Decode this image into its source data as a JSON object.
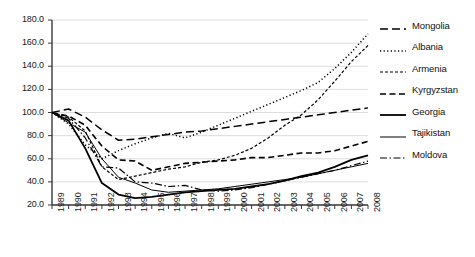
{
  "chart_data": {
    "type": "line",
    "title": "",
    "subtitle": "",
    "xlabel": "",
    "ylabel": "",
    "xlim": [
      1989,
      2008
    ],
    "ylim": [
      20.0,
      180.0
    ],
    "grid": true,
    "legend_position": "right",
    "y_ticks": [
      "180.0",
      "160.0",
      "140.0",
      "120.0",
      "100.0",
      "80.0",
      "60.0",
      "40.0",
      "20.0"
    ],
    "y_tick_values": [
      180,
      160,
      140,
      120,
      100,
      80,
      60,
      40,
      20
    ],
    "x": [
      1989,
      1990,
      1991,
      1992,
      1993,
      1994,
      1995,
      1996,
      1997,
      1998,
      1999,
      2000,
      2001,
      2002,
      2003,
      2004,
      2005,
      2006,
      2007,
      2008
    ],
    "categories": [
      "1989",
      "1990",
      "1991",
      "1992",
      "1993",
      "1994",
      "1995",
      "1996",
      "1997",
      "1998",
      "1999",
      "2000",
      "2001",
      "2002",
      "2003",
      "2004",
      "2005",
      "2006",
      "2007",
      "2008"
    ],
    "series": [
      {
        "name": "Mongolia",
        "dash": "long-dash",
        "values": [
          100,
          103,
          96,
          85,
          76,
          77,
          79,
          81,
          83,
          84,
          86,
          88,
          90,
          92,
          94,
          96,
          98,
          100,
          102,
          104
        ]
      },
      {
        "name": "Albania",
        "dash": "dotted",
        "values": [
          100,
          90,
          72,
          60,
          67,
          73,
          78,
          82,
          78,
          83,
          89,
          95,
          101,
          107,
          113,
          119,
          126,
          138,
          152,
          168
        ]
      },
      {
        "name": "Armenia",
        "dash": "short-dash",
        "values": [
          100,
          96,
          84,
          53,
          42,
          45,
          48,
          51,
          53,
          57,
          59,
          63,
          69,
          78,
          89,
          98,
          111,
          127,
          144,
          158
        ]
      },
      {
        "name": "Kyrgyzstan",
        "dash": "medium-dash",
        "values": [
          100,
          97,
          89,
          71,
          59,
          58,
          50,
          53,
          56,
          57,
          58,
          59,
          61,
          61,
          63,
          65,
          65,
          67,
          71,
          75
        ]
      },
      {
        "name": "Georgia",
        "dash": "solid",
        "values": [
          100,
          93,
          69,
          39,
          29,
          26,
          27,
          29,
          31,
          32,
          33,
          34,
          36,
          38,
          41,
          45,
          48,
          53,
          59,
          63
        ]
      },
      {
        "name": "Tajikistan",
        "dash": "thin-solid",
        "values": [
          100,
          91,
          83,
          60,
          44,
          39,
          33,
          31,
          32,
          33,
          34,
          36,
          38,
          40,
          42,
          44,
          47,
          50,
          53,
          56
        ]
      },
      {
        "name": "Moldova",
        "dash": "dash-dot",
        "values": [
          100,
          95,
          78,
          53,
          52,
          40,
          39,
          36,
          37,
          33,
          32,
          33,
          35,
          38,
          41,
          44,
          47,
          50,
          54,
          58
        ]
      }
    ]
  },
  "legend": {
    "items": [
      {
        "label": "Mongolia"
      },
      {
        "label": "Albania"
      },
      {
        "label": "Armenia"
      },
      {
        "label": "Kyrgyzstan"
      },
      {
        "label": "Georgia"
      },
      {
        "label": "Tajikistan"
      },
      {
        "label": "Moldova"
      }
    ]
  }
}
